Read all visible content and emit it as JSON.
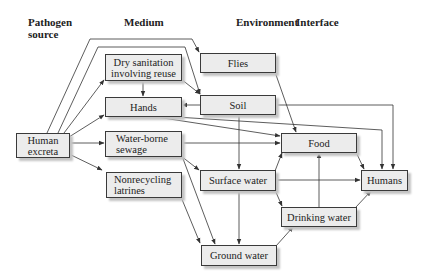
{
  "headers": {
    "pathogen_source": "Pathogen\nsource",
    "medium": "Medium",
    "environment": "Environment",
    "interface": "Interface"
  },
  "nodes": {
    "human_excreta": "Human\nexcreta",
    "dry_sanitation": "Dry sanitation\ninvolving reuse",
    "hands": "Hands",
    "water_borne_sewage": "Water-borne\nsewage",
    "nonrecycling_latrines": "Nonrecycling\nlatrines",
    "flies": "Flies",
    "soil": "Soil",
    "food": "Food",
    "surface_water": "Surface water",
    "humans": "Humans",
    "drinking_water": "Drinking water",
    "ground_water": "Ground water"
  },
  "edges": [
    {
      "from": "Human excreta",
      "to": "Flies"
    },
    {
      "from": "Human excreta",
      "to": "Soil"
    },
    {
      "from": "Human excreta",
      "to": "Dry sanitation involving reuse"
    },
    {
      "from": "Human excreta",
      "to": "Hands"
    },
    {
      "from": "Human excreta",
      "to": "Water-borne sewage"
    },
    {
      "from": "Human excreta",
      "to": "Nonrecycling latrines"
    },
    {
      "from": "Dry sanitation involving reuse",
      "to": "Hands"
    },
    {
      "from": "Dry sanitation involving reuse",
      "to": "Soil"
    },
    {
      "from": "Soil",
      "to": "Hands"
    },
    {
      "from": "Soil",
      "to": "Humans"
    },
    {
      "from": "Soil",
      "to": "Surface water",
      "bidirectional": true
    },
    {
      "from": "Hands",
      "to": "Food"
    },
    {
      "from": "Hands",
      "to": "Humans"
    },
    {
      "from": "Flies",
      "to": "Food"
    },
    {
      "from": "Water-borne sewage",
      "to": "Food"
    },
    {
      "from": "Water-borne sewage",
      "to": "Surface water"
    },
    {
      "from": "Water-borne sewage",
      "to": "Ground water"
    },
    {
      "from": "Nonrecycling latrines",
      "to": "Ground water"
    },
    {
      "from": "Surface water",
      "to": "Food"
    },
    {
      "from": "Surface water",
      "to": "Humans"
    },
    {
      "from": "Surface water",
      "to": "Drinking water"
    },
    {
      "from": "Surface water",
      "to": "Ground water",
      "bidirectional": true
    },
    {
      "from": "Ground water",
      "to": "Drinking water"
    },
    {
      "from": "Drinking water",
      "to": "Food"
    },
    {
      "from": "Drinking water",
      "to": "Humans"
    },
    {
      "from": "Food",
      "to": "Humans"
    }
  ],
  "colors": {
    "box_fill": "#ececec",
    "box_border": "#3a3a3a",
    "line": "#333333",
    "shadow": "#c4c4c4"
  }
}
